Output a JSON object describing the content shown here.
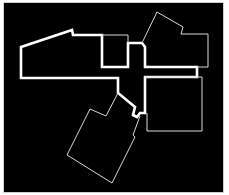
{
  "diagram": {
    "type": "floor-plan",
    "background": "#000000",
    "frame_border": "#cfcfcf",
    "stroke_color": "#ffffff",
    "rooms": [
      {
        "id": "corridor-main",
        "style": "thick",
        "points": "21,47 72,30 73,35 102,35 102,67 128,67 128,43 142,43 145,47 145,67 197,67 197,77 145,77 145,113 140,113 137,117 133,115 135,107 118,93 118,78 21,78"
      },
      {
        "id": "room-top-center",
        "style": "thin",
        "points": "102,35 128,35 128,43"
      },
      {
        "id": "room-top-right",
        "style": "thin",
        "points": "142,43 157,12 183,27 181,34 208,34 208,67 197,67"
      },
      {
        "id": "room-right",
        "style": "thin",
        "points": "145,77 202,77 202,131 147,131 147,113"
      },
      {
        "id": "room-bottom",
        "style": "thin",
        "points": "118,93 106,116 90,109 67,155 112,183 135,137 133,135 140,116"
      }
    ]
  }
}
